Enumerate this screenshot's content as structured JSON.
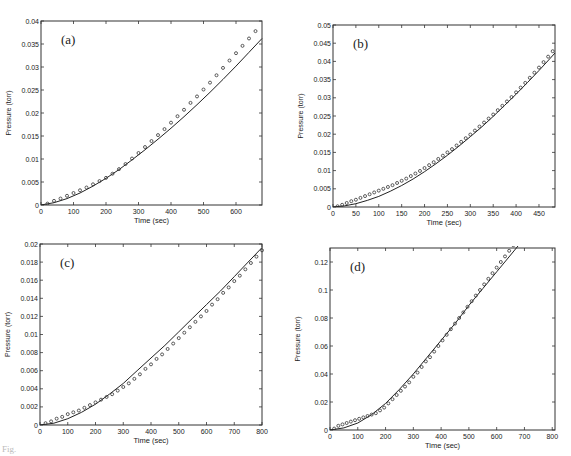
{
  "figure": {
    "caption": "Fig."
  },
  "chart_data": [
    {
      "panel": "(a)",
      "type": "line",
      "title": "",
      "xlabel": "Time (sec)",
      "ylabel": "Pressure (torr)",
      "xlim": [
        0,
        680
      ],
      "ylim": [
        0,
        0.04
      ],
      "xticks": [
        0,
        100,
        200,
        300,
        400,
        500,
        600
      ],
      "xtick_labels": [
        "0",
        "100",
        "200",
        "300",
        "400",
        "500",
        "600"
      ],
      "yticks": [
        0,
        0.005,
        0.01,
        0.015,
        0.02,
        0.025,
        0.03,
        0.035,
        0.04
      ],
      "ytick_labels": [
        "0",
        "0.005",
        "0.01",
        "0.015",
        "0.02",
        "0.025",
        "0.03",
        "0.035",
        "0.04"
      ],
      "grid": false,
      "frame": {
        "x": 41,
        "y": 21,
        "w": 221,
        "h": 184
      },
      "series": [
        {
          "name": "model",
          "style": "solid-line",
          "x": [
            0,
            40,
            80,
            120,
            160,
            200,
            240,
            280,
            320,
            360,
            400,
            440,
            480,
            520,
            560,
            600,
            640,
            680
          ],
          "y": [
            0,
            0.0005,
            0.0014,
            0.0026,
            0.0041,
            0.0058,
            0.0077,
            0.0098,
            0.012,
            0.0143,
            0.0167,
            0.0192,
            0.0218,
            0.0245,
            0.0273,
            0.0302,
            0.0332,
            0.0362,
            0.04
          ]
        },
        {
          "name": "measured",
          "style": "circle-markers",
          "x": [
            20,
            40,
            60,
            80,
            100,
            120,
            140,
            160,
            180,
            200,
            220,
            240,
            260,
            280,
            300,
            320,
            340,
            360,
            380,
            400,
            420,
            440,
            460,
            480,
            500,
            520,
            540,
            560,
            580,
            600,
            620,
            640,
            660
          ],
          "y": [
            0.0003,
            0.0009,
            0.0014,
            0.002,
            0.0026,
            0.0032,
            0.0038,
            0.0045,
            0.0052,
            0.0059,
            0.0068,
            0.0078,
            0.0089,
            0.0101,
            0.0113,
            0.0126,
            0.0139,
            0.0152,
            0.0165,
            0.0179,
            0.0193,
            0.0207,
            0.0222,
            0.0236,
            0.0251,
            0.0266,
            0.0282,
            0.0298,
            0.0314,
            0.033,
            0.0346,
            0.0362,
            0.0378
          ]
        }
      ]
    },
    {
      "panel": "(b)",
      "type": "line",
      "title": "",
      "xlabel": "Time (sec)",
      "ylabel": "Pressure (torr)",
      "xlim": [
        0,
        485
      ],
      "ylim": [
        0,
        0.05
      ],
      "xticks": [
        0,
        50,
        100,
        150,
        200,
        250,
        300,
        350,
        400,
        450
      ],
      "xtick_labels": [
        "0",
        "50",
        "100",
        "150",
        "200",
        "250",
        "300",
        "350",
        "400",
        "450"
      ],
      "yticks": [
        0,
        0.005,
        0.01,
        0.015,
        0.02,
        0.025,
        0.03,
        0.035,
        0.04,
        0.045,
        0.05
      ],
      "ytick_labels": [
        "0",
        "0.005",
        "0.01",
        "0.015",
        "0.02",
        "0.025",
        "0.03",
        "0.035",
        "0.04",
        "0.045",
        "0.05"
      ],
      "grid": false,
      "frame": {
        "x": 333,
        "y": 25,
        "w": 222,
        "h": 182
      },
      "series": [
        {
          "name": "model",
          "style": "solid-line",
          "x": [
            0,
            25,
            50,
            75,
            100,
            125,
            150,
            175,
            200,
            225,
            250,
            275,
            300,
            325,
            350,
            375,
            400,
            425,
            450,
            475,
            485
          ],
          "y": [
            0,
            0.0003,
            0.0009,
            0.0018,
            0.0029,
            0.0043,
            0.0059,
            0.0077,
            0.0097,
            0.0119,
            0.0142,
            0.0167,
            0.0193,
            0.022,
            0.0249,
            0.0279,
            0.031,
            0.0342,
            0.0375,
            0.0409,
            0.0423,
            0.0507
          ]
        },
        {
          "name": "measured",
          "style": "circle-markers",
          "x": [
            10,
            20,
            30,
            40,
            50,
            60,
            70,
            80,
            90,
            100,
            110,
            120,
            130,
            140,
            150,
            160,
            170,
            180,
            190,
            200,
            210,
            220,
            230,
            240,
            250,
            260,
            270,
            280,
            290,
            300,
            310,
            320,
            330,
            340,
            350,
            360,
            370,
            380,
            390,
            400,
            410,
            420,
            430,
            440,
            450,
            460,
            470,
            480
          ],
          "y": [
            0.0002,
            0.0006,
            0.0011,
            0.0016,
            0.002,
            0.0025,
            0.003,
            0.0035,
            0.004,
            0.0045,
            0.005,
            0.0055,
            0.006,
            0.0066,
            0.0072,
            0.0078,
            0.0085,
            0.0092,
            0.0099,
            0.0107,
            0.0115,
            0.0123,
            0.0132,
            0.0141,
            0.015,
            0.0159,
            0.0169,
            0.0179,
            0.0189,
            0.0199,
            0.021,
            0.0221,
            0.0232,
            0.0243,
            0.0254,
            0.0266,
            0.0278,
            0.029,
            0.0302,
            0.0315,
            0.0328,
            0.0341,
            0.0355,
            0.0369,
            0.0383,
            0.0398,
            0.0413,
            0.0428,
            0.0443,
            0.0458,
            0.0473,
            0.0488
          ]
        }
      ]
    },
    {
      "panel": "(c)",
      "type": "line",
      "title": "",
      "xlabel": "Time (sec)",
      "ylabel": "Pressure (torr)",
      "xlim": [
        0,
        800
      ],
      "ylim": [
        0,
        0.02
      ],
      "xticks": [
        0,
        100,
        200,
        300,
        400,
        500,
        600,
        700,
        800
      ],
      "xtick_labels": [
        "0",
        "100",
        "200",
        "300",
        "400",
        "500",
        "600",
        "700",
        "800"
      ],
      "yticks": [
        0,
        0.002,
        0.004,
        0.006,
        0.008,
        0.01,
        0.012,
        0.014,
        0.016,
        0.018,
        0.02
      ],
      "ytick_labels": [
        "0",
        "0.002",
        "0.004",
        "0.006",
        "0.008",
        "0.01",
        "0.012",
        "0.014",
        "0.016",
        "0.018",
        "0.02"
      ],
      "grid": false,
      "frame": {
        "x": 40,
        "y": 244,
        "w": 222,
        "h": 181
      },
      "series": [
        {
          "name": "model",
          "style": "solid-line",
          "x": [
            0,
            50,
            100,
            150,
            200,
            250,
            300,
            350,
            400,
            450,
            500,
            550,
            600,
            650,
            700,
            750,
            800
          ],
          "y": [
            0,
            0.0002,
            0.0007,
            0.0014,
            0.0023,
            0.0034,
            0.0046,
            0.006,
            0.0074,
            0.0088,
            0.0103,
            0.0118,
            0.0133,
            0.0148,
            0.0164,
            0.018,
            0.0196
          ]
        },
        {
          "name": "measured",
          "style": "circle-markers",
          "x": [
            20,
            40,
            60,
            80,
            100,
            120,
            140,
            160,
            180,
            200,
            220,
            240,
            260,
            280,
            300,
            320,
            340,
            360,
            380,
            400,
            420,
            440,
            460,
            480,
            500,
            520,
            540,
            560,
            580,
            600,
            620,
            640,
            660,
            680,
            700,
            720,
            740,
            760,
            780,
            800
          ],
          "y": [
            0.0002,
            0.0004,
            0.0007,
            0.0009,
            0.0012,
            0.0014,
            0.0016,
            0.0019,
            0.0022,
            0.0025,
            0.0028,
            0.0031,
            0.0034,
            0.0038,
            0.0042,
            0.0046,
            0.0051,
            0.0056,
            0.0062,
            0.0067,
            0.0073,
            0.0078,
            0.0084,
            0.009,
            0.0096,
            0.0102,
            0.0108,
            0.0114,
            0.012,
            0.0126,
            0.0133,
            0.0139,
            0.0146,
            0.0152,
            0.0159,
            0.0165,
            0.0172,
            0.0179,
            0.0186,
            0.0193
          ]
        }
      ]
    },
    {
      "panel": "(d)",
      "type": "line",
      "title": "",
      "xlabel": "Time (sec)",
      "ylabel": "Pressure (torr)",
      "xlim": [
        0,
        810
      ],
      "ylim": [
        0,
        0.13
      ],
      "xticks": [
        0,
        100,
        200,
        300,
        400,
        500,
        600,
        700,
        800
      ],
      "xtick_labels": [
        "0",
        "100",
        "200",
        "300",
        "400",
        "500",
        "600",
        "700",
        "800"
      ],
      "yticks": [
        0,
        0.02,
        0.04,
        0.06,
        0.08,
        0.1,
        0.12
      ],
      "ytick_labels": [
        "0",
        "0.02",
        "0.04",
        "0.06",
        "0.08",
        "0.1",
        "0.12"
      ],
      "grid": false,
      "frame": {
        "x": 330,
        "y": 248,
        "w": 225,
        "h": 182
      },
      "series": [
        {
          "name": "model",
          "style": "solid-line",
          "x": [
            0,
            50,
            100,
            150,
            200,
            250,
            300,
            350,
            400,
            450,
            500,
            550,
            600,
            650,
            700,
            750,
            810
          ],
          "y": [
            0,
            0.0015,
            0.005,
            0.011,
            0.019,
            0.029,
            0.04,
            0.052,
            0.064,
            0.076,
            0.089,
            0.101,
            0.113,
            0.125,
            0.137,
            0.149,
            0.164
          ]
        },
        {
          "name": "measured",
          "style": "circle-markers",
          "x": [
            15,
            30,
            45,
            60,
            75,
            90,
            105,
            120,
            135,
            150,
            165,
            180,
            195,
            210,
            225,
            240,
            255,
            270,
            285,
            300,
            315,
            330,
            345,
            360,
            375,
            390,
            405,
            420,
            435,
            450,
            465,
            480,
            495,
            510,
            525,
            540,
            555,
            570,
            585,
            600,
            615,
            630,
            645,
            660,
            675,
            690,
            705,
            720,
            735,
            750,
            765,
            780,
            795,
            810
          ],
          "y": [
            0.001,
            0.003,
            0.004,
            0.005,
            0.006,
            0.007,
            0.008,
            0.009,
            0.01,
            0.011,
            0.012,
            0.014,
            0.016,
            0.019,
            0.022,
            0.025,
            0.028,
            0.031,
            0.034,
            0.038,
            0.041,
            0.045,
            0.049,
            0.052,
            0.056,
            0.06,
            0.064,
            0.068,
            0.072,
            0.076,
            0.08,
            0.084,
            0.088,
            0.092,
            0.096,
            0.1,
            0.104,
            0.108,
            0.112,
            0.116,
            0.12,
            0.124,
            0.128,
            0.132,
            0.136,
            0.14,
            0.144,
            0.148,
            0.152,
            0.156,
            0.16,
            0.164,
            0.168,
            0.172
          ]
        }
      ]
    }
  ]
}
